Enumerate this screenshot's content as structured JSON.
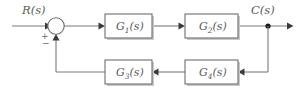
{
  "diagram": {
    "input_label": "R(s)",
    "output_label": "C(s)",
    "sum_sign_positive": "+",
    "sum_sign_negative": "−",
    "blocks": [
      {
        "id": "g1",
        "label": "G",
        "subscript": "1",
        "arg": "(s)",
        "full": "G1(s)",
        "role": "forward-path-first"
      },
      {
        "id": "g2",
        "label": "G",
        "subscript": "2",
        "arg": "(s)",
        "full": "G2(s)",
        "role": "forward-path-second"
      },
      {
        "id": "g3",
        "label": "G",
        "subscript": "3",
        "arg": "(s)",
        "full": "G3(s)",
        "role": "feedback-path-second"
      },
      {
        "id": "g4",
        "label": "G",
        "subscript": "4",
        "arg": "(s)",
        "full": "G4(s)",
        "role": "feedback-path-first"
      }
    ],
    "nodes": {
      "summing_junction": "summing-junction",
      "takeoff_point": "output-takeoff-node"
    },
    "colors": {
      "line": "#7a7a7a",
      "block_stroke": "#6e6e6e",
      "block_fill": "#ffffff",
      "shadow": "#c9c9c9",
      "text": "#5a5a5a",
      "node": "#1a1a1a",
      "background": "#ffffff"
    }
  }
}
